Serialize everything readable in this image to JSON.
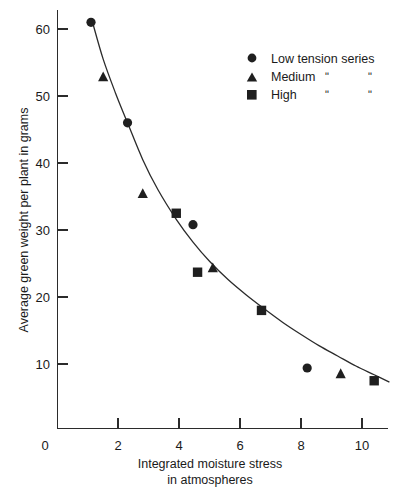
{
  "chart_data": {
    "type": "scatter",
    "title": "",
    "xlabel": "Integrated moisture stress in atmospheres",
    "xlabel_line1": "Integrated moisture stress",
    "xlabel_line2": "in  atmospheres",
    "ylabel": "Average green weight per plant in grams",
    "xlim": [
      0,
      11.2
    ],
    "ylim": [
      0,
      64
    ],
    "xticks": [
      0,
      2,
      4,
      6,
      8,
      10
    ],
    "xtick_labels": [
      "0",
      "2",
      "4",
      "6",
      "8",
      "10"
    ],
    "yticks": [
      10,
      20,
      30,
      40,
      50,
      60
    ],
    "ytick_labels": [
      "10",
      "20",
      "30",
      "40",
      "50",
      "60"
    ],
    "grid": false,
    "legend_position": "top-right",
    "series": [
      {
        "name": "Low tension series",
        "marker": "circle",
        "color": "#1f1f1f",
        "x": [
          1.1,
          2.3,
          4.45,
          8.2
        ],
        "y": [
          61.0,
          46.0,
          30.8,
          9.4
        ]
      },
      {
        "name": "Medium",
        "marker": "triangle",
        "color": "#1f1f1f",
        "x": [
          1.5,
          2.8,
          5.1,
          9.3
        ],
        "y": [
          52.8,
          35.4,
          24.3,
          8.5
        ]
      },
      {
        "name": "High",
        "marker": "square",
        "color": "#1f1f1f",
        "x": [
          3.9,
          4.6,
          6.7,
          10.4
        ],
        "y": [
          32.5,
          23.7,
          18.0,
          7.5
        ]
      }
    ],
    "fit_curve": {
      "description": "smooth decaying trend line through all series",
      "points": [
        [
          1.15,
          61.0
        ],
        [
          1.5,
          55.5
        ],
        [
          1.9,
          50.5
        ],
        [
          2.3,
          46.0
        ],
        [
          2.8,
          40.5
        ],
        [
          3.3,
          36.0
        ],
        [
          3.9,
          31.6
        ],
        [
          4.45,
          28.2
        ],
        [
          5.0,
          25.3
        ],
        [
          5.6,
          22.6
        ],
        [
          6.2,
          20.3
        ],
        [
          6.8,
          18.2
        ],
        [
          7.4,
          16.2
        ],
        [
          8.0,
          14.4
        ],
        [
          8.6,
          12.7
        ],
        [
          9.2,
          11.2
        ],
        [
          9.8,
          9.7
        ],
        [
          10.4,
          8.4
        ],
        [
          10.9,
          7.3
        ]
      ]
    }
  },
  "legend": {
    "entries": [
      {
        "marker": "circle-marker",
        "label": "Low tension series",
        "ditto1": "",
        "ditto2": ""
      },
      {
        "marker": "triangle-marker",
        "label": "Medium",
        "ditto1": "ʺ",
        "ditto2": "ʺ"
      },
      {
        "marker": "square-marker",
        "label": "High",
        "ditto1": "ʺ",
        "ditto2": "ʺ"
      }
    ]
  },
  "axes": {
    "y_title": "Average green weight per plant in grams",
    "x_title_line1": "Integrated moisture stress",
    "x_title_line2": "in  atmospheres",
    "origin_label": "0"
  }
}
